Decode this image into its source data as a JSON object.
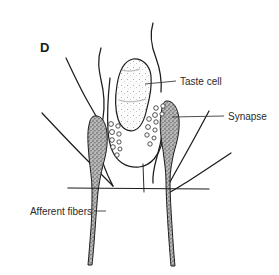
{
  "figure": {
    "panel_letter": "D",
    "background_color": "#ffffff",
    "ink_color": "#1d1d1d",
    "label_color": "#2b2b2b"
  },
  "labels": [
    {
      "id": "taste-cell",
      "text": "Taste cell",
      "align": "right",
      "text_x": 180,
      "text_y": 86,
      "leader_points": "145,84 176,81"
    },
    {
      "id": "synapse",
      "text": "Synapse",
      "align": "right",
      "text_x": 228,
      "text_y": 120,
      "leader_points": "172,117 224,116"
    },
    {
      "id": "afferent-fibers",
      "text": "Afferent fibers",
      "align": "left",
      "text_x": 16,
      "text_y": 214,
      "leader_points": "94,211 106,211"
    }
  ],
  "structures": {
    "taste_cell": {
      "name": "taste-cell",
      "fill": "#fbfbfb",
      "stipple": "light"
    },
    "nerve_terminal_left": {
      "name": "nerve-terminal-left",
      "fill": "#9a9a9a",
      "stipple": "dark"
    },
    "nerve_terminal_right": {
      "name": "nerve-terminal-right",
      "fill": "#9a9a9a",
      "stipple": "dark"
    },
    "vesicle_count_left": 9,
    "vesicle_count_right": 11
  }
}
